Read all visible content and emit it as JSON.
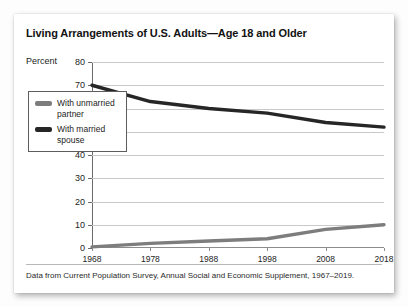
{
  "card": {
    "title": "Living Arrangements of U.S. Adults—Age 18 and Older",
    "footnote": "Data from Current Population Survey, Annual Social and Economic Supplement, 1967–2019."
  },
  "chart_data": {
    "type": "line",
    "title": "Living Arrangements of U.S. Adults—Age 18 and Older",
    "xlabel": "",
    "ylabel": "Percent",
    "x": [
      1968,
      1978,
      1988,
      1998,
      2008,
      2018
    ],
    "xtick_labels": [
      "1968",
      "1978",
      "1988",
      "1998",
      "2008",
      "2018"
    ],
    "xlim": [
      1968,
      2018
    ],
    "ylim": [
      0,
      80
    ],
    "ytick_labels": [
      "0",
      "10",
      "20",
      "30",
      "40",
      "50",
      "60",
      "70",
      "80"
    ],
    "yticks": [
      0,
      10,
      20,
      30,
      40,
      50,
      60,
      70,
      80
    ],
    "grid": "horizontal",
    "legend_position": "inside-left",
    "series": [
      {
        "name": "With unmarried partner",
        "color": "#7d7d7d",
        "values": [
          0.5,
          2,
          3,
          4,
          8,
          10
        ]
      },
      {
        "name": "With married spouse",
        "color": "#262626",
        "values": [
          70,
          63,
          60,
          58,
          54,
          52
        ]
      }
    ]
  },
  "axis": {
    "unit_label": "Percent"
  },
  "legend": {
    "items": [
      {
        "label": "With unmarried partner",
        "color": "#7d7d7d"
      },
      {
        "label": "With married spouse",
        "color": "#262626"
      }
    ]
  }
}
